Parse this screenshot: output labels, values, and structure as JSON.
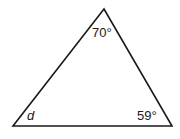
{
  "diagram": {
    "type": "triangle",
    "vertices": {
      "apex": {
        "x": 104,
        "y": 9
      },
      "bottom_left": {
        "x": 13,
        "y": 126
      },
      "bottom_right": {
        "x": 172,
        "y": 126
      }
    },
    "angles": {
      "apex": "70°",
      "bottom_left": "d",
      "bottom_right": "59°"
    },
    "stroke_color": "#1a1a1a"
  }
}
